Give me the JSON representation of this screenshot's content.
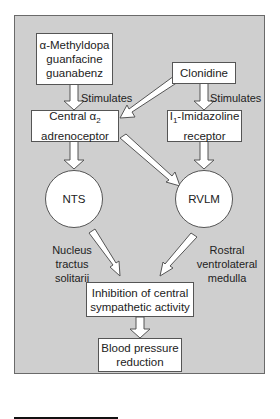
{
  "diagram": {
    "nodes": {
      "methyldopa": {
        "line1": "α-Methyldopa",
        "line2": "guanfacine",
        "line3": "guanabenz"
      },
      "clonidine": {
        "label": "Clonidine"
      },
      "alpha2": {
        "line1_prefix": "Central α",
        "line1_sub": "2",
        "line2": "adrenoceptor"
      },
      "imidazoline": {
        "line1_prefix": "I",
        "line1_sub": "1",
        "line1_suffix": "-Imidazoline",
        "line2": "receptor"
      },
      "nts": {
        "label": "NTS"
      },
      "rvlm": {
        "label": "RVLM"
      },
      "inhibition": {
        "line1": "Inhibition of central",
        "line2": "sympathetic activity"
      },
      "bp": {
        "line1": "Blood pressure",
        "line2": "reduction"
      }
    },
    "edge_labels": {
      "stimulates_left": "Stimulates",
      "stimulates_right": "Stimulates",
      "nts_full": [
        "Nucleus",
        "tractus",
        "solitarii"
      ],
      "rvlm_full": [
        "Rostral",
        "ventrolateral",
        "medulla"
      ]
    },
    "colors": {
      "panel": "#cfcfcf",
      "box": "#ffffff",
      "border": "#555555"
    }
  }
}
